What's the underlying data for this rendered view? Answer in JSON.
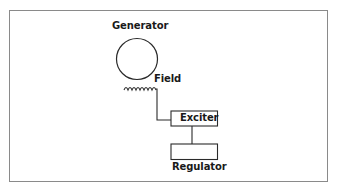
{
  "diagram": {
    "type": "block-diagram",
    "nodes": [
      {
        "id": "generator",
        "label": "Generator",
        "shape": "circle"
      },
      {
        "id": "field",
        "label": "Field",
        "shape": "coil"
      },
      {
        "id": "exciter",
        "label": "Exciter",
        "shape": "box"
      },
      {
        "id": "regulator",
        "label": "Regulator",
        "shape": "box"
      }
    ],
    "edges": [
      {
        "from": "field",
        "to": "exciter"
      },
      {
        "from": "exciter",
        "to": "regulator"
      }
    ]
  },
  "labels": {
    "generator": "Generator",
    "field": "Field",
    "exciter": "Exciter",
    "regulator": "Regulator"
  },
  "colors": {
    "stroke": "#2a2a2a",
    "frame": "#8a8a8a",
    "background": "#ffffff"
  }
}
